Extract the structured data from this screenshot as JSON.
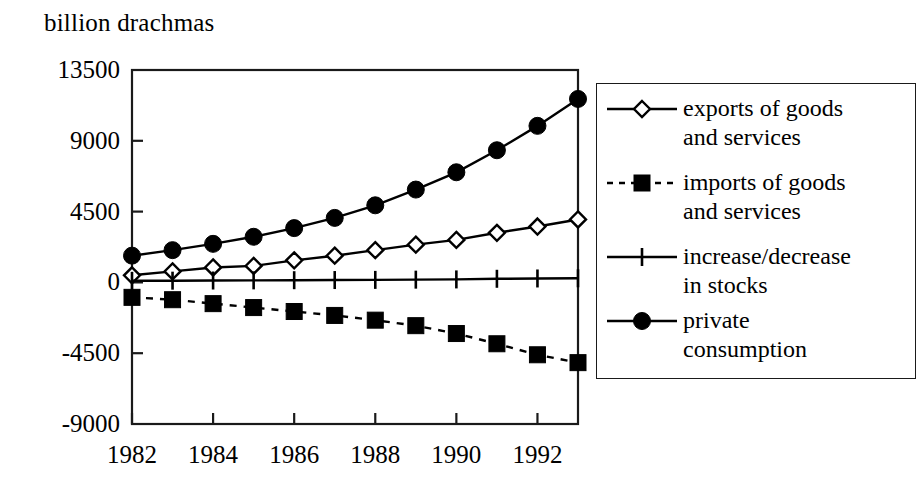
{
  "chart_data": {
    "type": "line",
    "title": "billion drachmas",
    "xlabel": "",
    "ylabel": "billion drachmas",
    "ylim": [
      -9000,
      13500
    ],
    "xlim": [
      1982,
      1993
    ],
    "grid": false,
    "legend_position": "right",
    "ytick_labels": [
      "13500",
      "9000",
      "4500",
      "0",
      "-4500",
      "-9000"
    ],
    "ytick_values": [
      13500,
      9000,
      4500,
      0,
      -4500,
      -9000
    ],
    "xtick_labels": [
      "1982",
      "1984",
      "1986",
      "1988",
      "1990",
      "1992"
    ],
    "xtick_values": [
      1982,
      1984,
      1986,
      1988,
      1990,
      1992
    ],
    "x": [
      1982,
      1983,
      1984,
      1985,
      1986,
      1987,
      1988,
      1989,
      1990,
      1991,
      1992,
      1993
    ],
    "series": [
      {
        "name": "exports of goods and services",
        "label_line1": "exports of goods",
        "label_line2": "and services",
        "marker": "open-diamond",
        "line": "solid",
        "color": "#000000",
        "values": [
          450,
          700,
          950,
          1050,
          1400,
          1700,
          2050,
          2400,
          2700,
          3150,
          3550,
          4000
        ]
      },
      {
        "name": "imports of goods and services",
        "label_line1": "imports of goods",
        "label_line2": "and services",
        "marker": "filled-square",
        "line": "dashed",
        "color": "#000000",
        "values": [
          -950,
          -1100,
          -1350,
          -1600,
          -1850,
          -2100,
          -2400,
          -2750,
          -3250,
          -3900,
          -4600,
          -5100
        ]
      },
      {
        "name": "increase/decrease in stocks",
        "label_line1": "increase/decrease",
        "label_line2": "in stocks",
        "marker": "plus",
        "line": "solid",
        "color": "#000000",
        "values": [
          100,
          110,
          120,
          130,
          140,
          150,
          160,
          175,
          190,
          230,
          250,
          260
        ]
      },
      {
        "name": "private consumption",
        "label_line1": "private",
        "label_line2": "consumption",
        "marker": "filled-circle",
        "line": "solid",
        "color": "#000000",
        "values": [
          1700,
          2050,
          2450,
          2900,
          3450,
          4100,
          4900,
          5900,
          7000,
          8400,
          9950,
          11660
        ]
      }
    ]
  },
  "colors": {
    "ink": "#000000",
    "frame": "#1a1a1a",
    "background": "#ffffff"
  }
}
